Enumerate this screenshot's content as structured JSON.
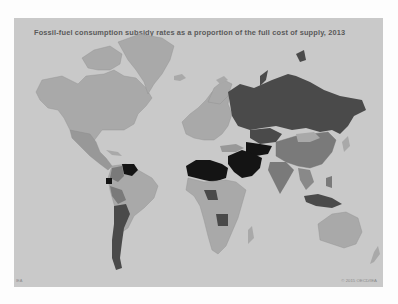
{
  "title": "Fossil-fuel consumption subsidy rates as a proportion of the full cost of supply, 2013",
  "copyright": "© 2015 OECD/IEA",
  "corner_mark": "IEA",
  "colors": {
    "ocean": "#c9c9c9",
    "no_data": "#a9a9a9",
    "low": "#989898",
    "medium": "#7a7a7a",
    "high": "#4a4a4a",
    "very_high": "#141414"
  },
  "regions": [
    {
      "name": "North America",
      "shade": "no_data"
    },
    {
      "name": "Greenland",
      "shade": "no_data"
    },
    {
      "name": "Mexico",
      "shade": "low"
    },
    {
      "name": "Venezuela",
      "shade": "very_high"
    },
    {
      "name": "Ecuador",
      "shade": "very_high"
    },
    {
      "name": "Colombia",
      "shade": "medium"
    },
    {
      "name": "Argentina",
      "shade": "high"
    },
    {
      "name": "Bolivia",
      "shade": "medium"
    },
    {
      "name": "Brazil",
      "shade": "no_data"
    },
    {
      "name": "Europe",
      "shade": "no_data"
    },
    {
      "name": "Russia",
      "shade": "high"
    },
    {
      "name": "Kazakhstan",
      "shade": "high"
    },
    {
      "name": "North Africa (Algeria, Libya, Egypt)",
      "shade": "very_high"
    },
    {
      "name": "Middle East (Saudi Arabia, Iran, Iraq)",
      "shade": "very_high"
    },
    {
      "name": "Central Asia (Turkmenistan, Uzbekistan)",
      "shade": "very_high"
    },
    {
      "name": "China",
      "shade": "medium"
    },
    {
      "name": "India",
      "shade": "medium"
    },
    {
      "name": "Indonesia",
      "shade": "high"
    },
    {
      "name": "Nigeria",
      "shade": "high"
    },
    {
      "name": "Angola",
      "shade": "high"
    },
    {
      "name": "Sub-Saharan Africa",
      "shade": "no_data"
    },
    {
      "name": "Australia",
      "shade": "no_data"
    }
  ]
}
